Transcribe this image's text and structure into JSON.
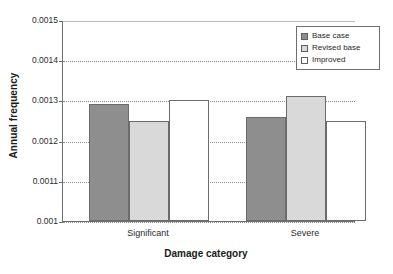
{
  "chart_data": {
    "type": "bar",
    "title": "",
    "xlabel": "Damage category",
    "ylabel": "Annual frequency",
    "categories": [
      "Significant",
      "Severe"
    ],
    "series": [
      {
        "name": "Base case",
        "values": [
          0.00129,
          0.001258
        ],
        "color": "#8e8e8e"
      },
      {
        "name": "Revised base",
        "values": [
          0.00125,
          0.00131
        ],
        "color": "#d9d9d9"
      },
      {
        "name": "Improved",
        "values": [
          0.0013,
          0.00125
        ],
        "color": "#ffffff"
      }
    ],
    "ylim": [
      0.001,
      0.0015
    ],
    "yticks": [
      0.001,
      0.0011,
      0.0012,
      0.0013,
      0.0014,
      0.0015
    ],
    "ytick_labels": [
      "0.001",
      "0.0011",
      "0.0012",
      "0.0013",
      "0.0014",
      "0.0015"
    ],
    "grid": true,
    "grid_axis": "y",
    "legend_position": "top-right-inside"
  },
  "legend": {
    "items": [
      {
        "label": "Base case",
        "color": "#8e8e8e"
      },
      {
        "label": "Revised base",
        "color": "#d9d9d9"
      },
      {
        "label": "Improved",
        "color": "#ffffff"
      }
    ]
  },
  "axes": {
    "y_title": "Annual frequency",
    "x_title": "Damage category"
  }
}
